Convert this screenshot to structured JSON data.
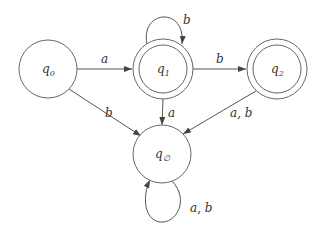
{
  "diagram": {
    "type": "finite-automaton",
    "colors": {
      "stroke": "#555555",
      "text": "#333333",
      "background": "#ffffff"
    },
    "states": [
      {
        "id": "q0",
        "base": "q",
        "sub": "0",
        "accepting": false
      },
      {
        "id": "q1",
        "base": "q",
        "sub": "1",
        "accepting": true
      },
      {
        "id": "q2",
        "base": "q",
        "sub": "2",
        "accepting": true
      },
      {
        "id": "qempty",
        "base": "q",
        "sub": "∅",
        "accepting": false
      }
    ],
    "transitions": [
      {
        "from": "q0",
        "to": "q1",
        "label": "a"
      },
      {
        "from": "q0",
        "to": "qempty",
        "label": "b"
      },
      {
        "from": "q1",
        "to": "q1",
        "label": "b"
      },
      {
        "from": "q1",
        "to": "q2",
        "label": "b"
      },
      {
        "from": "q1",
        "to": "qempty",
        "label": "a"
      },
      {
        "from": "q2",
        "to": "qempty",
        "label": "a, b"
      },
      {
        "from": "qempty",
        "to": "qempty",
        "label": "a, b"
      }
    ]
  }
}
